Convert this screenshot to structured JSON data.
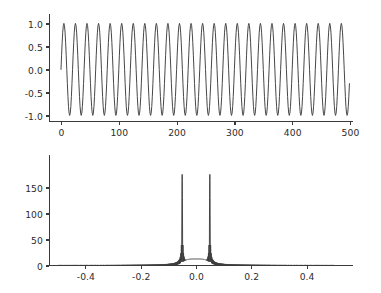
{
  "figure": {
    "background_color": "#ffffff",
    "line_color": "#3d3d3d",
    "axis_color": "#3a3a3a",
    "text_color": "#2b2b2b",
    "width": 381,
    "height": 293
  },
  "chart_data": [
    {
      "type": "line",
      "name": "time-domain-signal",
      "title": "",
      "xlabel": "",
      "ylabel": "",
      "xlim": [
        -12,
        515
      ],
      "ylim": [
        -1.12,
        1.12
      ],
      "grid": false,
      "legend": null,
      "xticks": [
        0,
        100,
        200,
        300,
        400,
        500
      ],
      "xticklabels": [
        "0",
        "100",
        "200",
        "300",
        "400",
        "500"
      ],
      "yticks": [
        -1.0,
        -0.5,
        0.0,
        0.5,
        1.0
      ],
      "yticklabels": [
        "-1.0",
        "-0.5",
        "0.0",
        "0.5",
        "1.0"
      ],
      "series": [
        {
          "name": "sine",
          "description": "sin(2*pi*0.05*n), n = 0..499",
          "amplitude": 1.0,
          "frequency_cycles_per_sample": 0.05,
          "period_samples": 20,
          "n_samples": 500,
          "n_cycles": 25,
          "phase": 0.0,
          "y_min": -1.0,
          "y_max": 1.0
        }
      ]
    },
    {
      "type": "line",
      "name": "magnitude-spectrum",
      "title": "",
      "xlabel": "",
      "ylabel": "",
      "xlim": [
        -0.55,
        0.55
      ],
      "ylim": [
        -4,
        185
      ],
      "grid": false,
      "legend": null,
      "xticks": [
        -0.4,
        -0.2,
        0.0,
        0.2,
        0.4
      ],
      "xticklabels": [
        "-0.4",
        "-0.2",
        "0.0",
        "0.2",
        "0.4"
      ],
      "yticks": [
        0,
        50,
        100,
        150
      ],
      "yticklabels": [
        "0",
        "50",
        "100",
        "150"
      ],
      "series": [
        {
          "name": "fft-magnitude",
          "description": "abs(fftshift(fft(signal))) vs normalized frequency",
          "peaks": [
            {
              "x": -0.05,
              "y": 175
            },
            {
              "x": 0.05,
              "y": 175
            }
          ],
          "baseline": 0,
          "sidelobe_hump_between_peaks_y": 13,
          "y_min": 0,
          "y_max": 175
        }
      ]
    }
  ]
}
